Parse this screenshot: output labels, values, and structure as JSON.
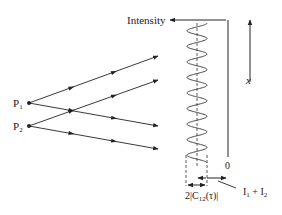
{
  "diagram": {
    "labels": {
      "intensity": "Intensity",
      "x_axis": "x",
      "origin": "0",
      "source1_main": "P",
      "source1_sub": "1",
      "source2_main": "P",
      "source2_sub": "2",
      "amplitude_main": "2|C",
      "amplitude_sub": "12",
      "amplitude_tail": "(τ)|",
      "mean_intensity_a": "I",
      "mean_intensity_a_sub": "1",
      "mean_intensity_plus": " + ",
      "mean_intensity_b": "I",
      "mean_intensity_b_sub": "2"
    },
    "sources": [
      {
        "id": "P1",
        "x": 29,
        "y": 103
      },
      {
        "id": "P2",
        "x": 29,
        "y": 126
      }
    ],
    "rays": [
      {
        "from": "P1",
        "to": [
          158,
          56
        ]
      },
      {
        "from": "P1",
        "to": [
          158,
          126
        ]
      },
      {
        "from": "P2",
        "to": [
          158,
          80
        ]
      },
      {
        "from": "P2",
        "to": [
          158,
          149
        ]
      }
    ],
    "fringe_pattern": {
      "cycles": 9,
      "center_x": 197,
      "amplitude_px": 10,
      "y_start": 23,
      "y_end": 163
    },
    "colors": {
      "line": "#222222",
      "background": "#ffffff"
    }
  }
}
